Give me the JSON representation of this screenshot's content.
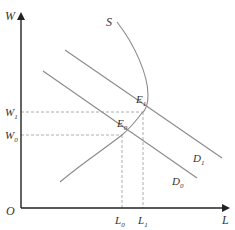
{
  "diagram": {
    "type": "labor-market supply-demand",
    "axes": {
      "y_label": "W",
      "x_label": "L",
      "origin_label": "O"
    },
    "curves": {
      "supply": {
        "label": "S",
        "shape": "backward-bending"
      },
      "demand_0": {
        "label": "D",
        "sub": "0"
      },
      "demand_1": {
        "label": "D",
        "sub": "1"
      }
    },
    "equilibria": {
      "e0": {
        "label": "E",
        "sub": "0"
      },
      "e1": {
        "label": "E",
        "sub": "1"
      }
    },
    "y_ticks": {
      "w1": {
        "label": "W",
        "sub": "1"
      },
      "w0": {
        "label": "W",
        "sub": "0"
      }
    },
    "x_ticks": {
      "l0": {
        "label": "L",
        "sub": "0"
      },
      "l1": {
        "label": "L",
        "sub": "1"
      }
    },
    "colors": {
      "axis": "#222222",
      "curve": "#8a8a8a",
      "guide": "#9a9a9a",
      "text": "#333333"
    }
  }
}
